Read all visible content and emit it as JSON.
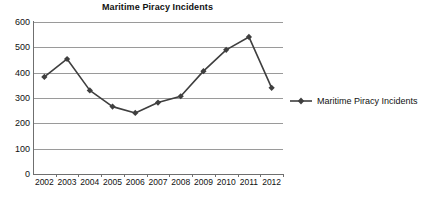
{
  "chart_data": {
    "type": "line",
    "title": "Maritime Piracy Incidents",
    "xlabel": "",
    "ylabel": "",
    "categories": [
      "2002",
      "2003",
      "2004",
      "2005",
      "2006",
      "2007",
      "2008",
      "2009",
      "2010",
      "2011",
      "2012"
    ],
    "series": [
      {
        "name": "Maritime Piracy Incidents",
        "values": [
          383,
          454,
          330,
          266,
          241,
          282,
          307,
          406,
          490,
          541,
          340
        ],
        "color": "#3f3f3f",
        "marker": "diamond"
      }
    ],
    "ylim": [
      0,
      600
    ],
    "yticks": [
      0,
      100,
      200,
      300,
      400,
      500,
      600
    ],
    "ytick_labels": [
      "0",
      "100",
      "200",
      "300",
      "400",
      "500",
      "600"
    ],
    "grid": "horizontal",
    "legend_position": "right"
  },
  "legend": {
    "entries": [
      {
        "label": "Maritime Piracy Incidents"
      }
    ]
  }
}
